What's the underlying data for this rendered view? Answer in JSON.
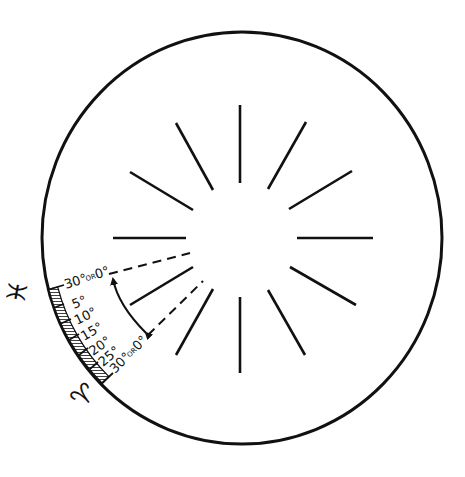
{
  "diagram": {
    "colors": {
      "ink": "#111111",
      "background": "#ffffff"
    },
    "circle": {
      "cx": 242,
      "cy": 238,
      "rx": 200,
      "ry": 206
    },
    "rays": {
      "count": 12,
      "cx": 240,
      "cy": 238,
      "inner_r": 56,
      "outer_r": 134
    },
    "signs": {
      "upper": {
        "name": "Pisces",
        "glyph": "♓"
      },
      "lower": {
        "name": "Aries",
        "glyph": "♈"
      }
    },
    "scale": {
      "start_label": {
        "main": "30°",
        "or": "OR",
        "alt": "0°"
      },
      "labels": [
        "5°",
        "10°",
        "15°",
        "20°",
        "25°"
      ],
      "end_label": {
        "main": "30°",
        "or": "OR",
        "alt": "0°"
      }
    },
    "indicator": {
      "type": "double-headed curved arrow between two dashed lines",
      "dashed_lines": 2
    }
  }
}
